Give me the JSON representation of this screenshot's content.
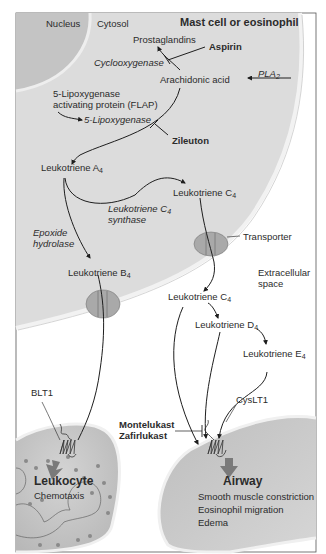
{
  "diagram": {
    "title": "Mast cell or eosinophil",
    "regions": {
      "nucleus": "Nucleus",
      "cytosol": "Cytosol",
      "extracellular_line1": "Extracellular",
      "extracellular_line2": "space"
    },
    "molecules": {
      "prostaglandins": "Prostaglandins",
      "arachidonic_acid": "Arachidonic acid",
      "flap_line1": "5-Lipoxygenase",
      "flap_line2": "activating protein (FLAP)",
      "lta4": "Leukotriene A",
      "lta4_sub": "4",
      "ltc4_inside": "Leukotriene C",
      "ltc4_inside_sub": "4",
      "ltb4": "Leukotriene B",
      "ltb4_sub": "4",
      "ltc4_outside": "Leukotriene C",
      "ltc4_outside_sub": "4",
      "ltd4": "Leukotriene D",
      "ltd4_sub": "4",
      "lte4": "Leukotriene E",
      "lte4_sub": "4"
    },
    "enzymes": {
      "cyclooxygenase": "Cyclooxygenase",
      "pla2": "PLA",
      "pla2_sub": "2",
      "five_lipoxygenase": "5-Lipoxygenase",
      "ltc4_synthase_line1": "Leukotriene C",
      "ltc4_synthase_sub": "4",
      "ltc4_synthase_line2": "synthase",
      "epoxide_line1": "Epoxide",
      "epoxide_line2": "hydrolase"
    },
    "drugs": {
      "aspirin": "Aspirin",
      "zileuton": "Zileuton",
      "montelukast": "Montelukast",
      "zafirlukast": "Zafirlukast"
    },
    "proteins": {
      "transporter": "Transporter",
      "blt1": "BLT1",
      "cyslt1": "CysLT1"
    },
    "targets": {
      "leukocyte": {
        "name": "Leukocyte",
        "effects": [
          "Chemotaxis"
        ]
      },
      "airway": {
        "name": "Airway",
        "effects": [
          "Smooth muscle constriction",
          "Eosinophil migration",
          "Edema"
        ]
      }
    },
    "colors": {
      "cell_fill": "#dcdcdc",
      "nucleus_fill": "#c4c4c4",
      "membrane": "#efefef",
      "target_fill": "#c8c8c8",
      "arrow": "#1e1e1e",
      "transporter_fill": "#a9a9a9",
      "effect_arrow": "#7a7a7a",
      "frame": "#555555"
    }
  }
}
